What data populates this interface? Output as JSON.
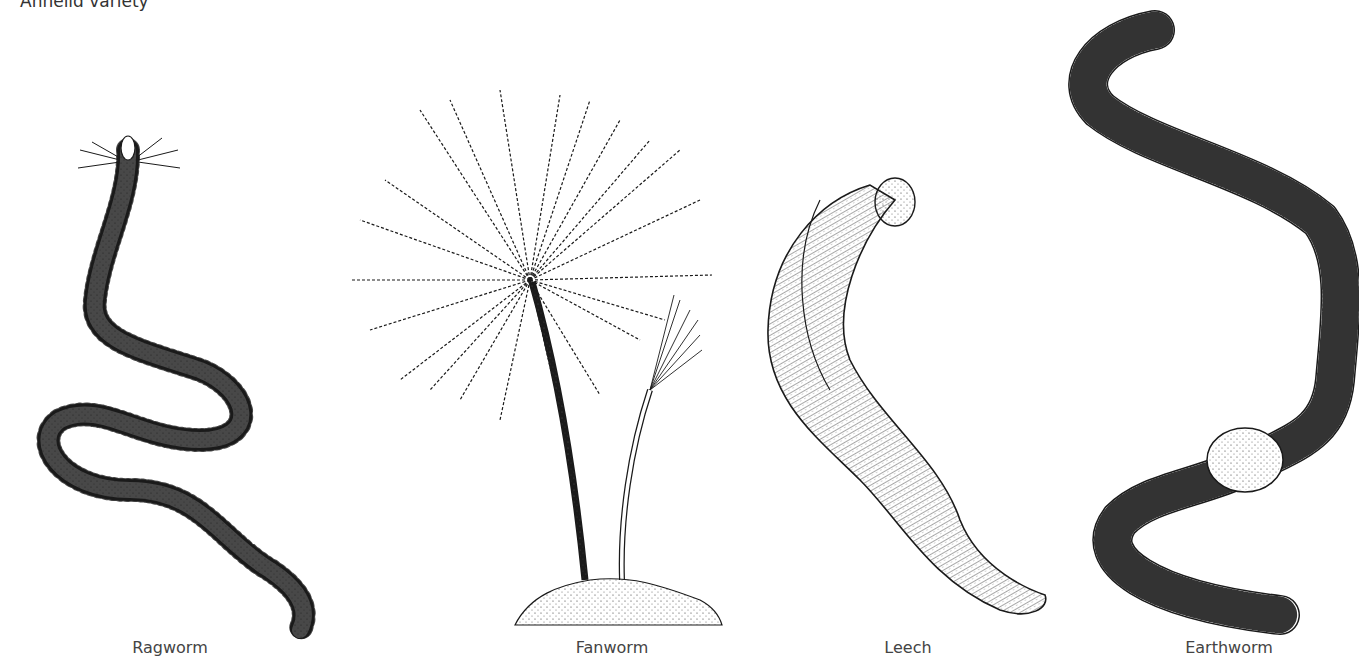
{
  "title": "Annelid variety",
  "specimens": [
    {
      "name": "Ragworm",
      "label_x": 170
    },
    {
      "name": "Fanworm",
      "label_x": 612
    },
    {
      "name": "Leech",
      "label_x": 908
    },
    {
      "name": "Earthworm",
      "label_x": 1229
    }
  ],
  "colors": {
    "ink": "#1a1a1a",
    "background": "#ffffff",
    "text": "#444444"
  }
}
